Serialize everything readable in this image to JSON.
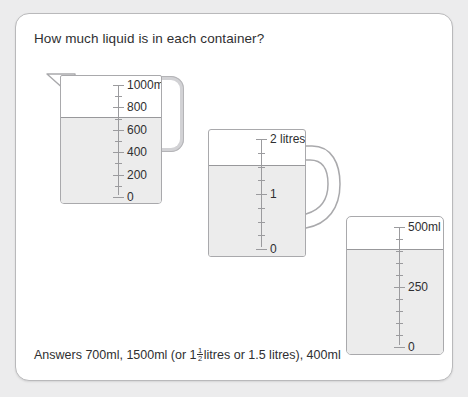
{
  "page": {
    "title": "How much liquid is in each container?",
    "background_color": "#ececed",
    "card_color": "#ffffff",
    "border_color": "#b9b9bb",
    "text_color": "#2f2f31",
    "liquid_color": "#ececec"
  },
  "answers": {
    "prefix": "Answers 700ml, 1500ml (or 1",
    "fraction_numerator": "1",
    "fraction_denominator": "2",
    "suffix": " litres or 1.5 litres), 400ml"
  },
  "containers": [
    {
      "id": "jug1",
      "name": "measuring-jug-1000ml",
      "unit": "ml",
      "scale_min": 0,
      "scale_max": 1000,
      "fill_value": 700,
      "has_spout": true,
      "handle_style": "rounded-rectangle",
      "major_step": 200,
      "minor_step": 100,
      "labels": [
        {
          "value": 1000,
          "text": "1000ml"
        },
        {
          "value": 800,
          "text": "800"
        },
        {
          "value": 600,
          "text": "600"
        },
        {
          "value": 400,
          "text": "400"
        },
        {
          "value": 200,
          "text": "200"
        },
        {
          "value": 0,
          "text": "0"
        }
      ]
    },
    {
      "id": "jug2",
      "name": "measuring-jug-2-litres",
      "unit": "litres",
      "scale_min": 0,
      "scale_max": 2,
      "fill_value": 1.5,
      "has_spout": false,
      "handle_style": "curved-mug",
      "major_step": 1,
      "minor_step": 0.25,
      "labels": [
        {
          "value": 2,
          "text": "2 litres"
        },
        {
          "value": 1,
          "text": "1"
        },
        {
          "value": 0,
          "text": "0"
        }
      ]
    },
    {
      "id": "jug3",
      "name": "measuring-beaker-500ml",
      "unit": "ml",
      "scale_min": 0,
      "scale_max": 500,
      "fill_value": 400,
      "has_spout": false,
      "handle_style": "none",
      "major_step": 250,
      "minor_step": 50,
      "labels": [
        {
          "value": 500,
          "text": "500ml"
        },
        {
          "value": 250,
          "text": "250"
        },
        {
          "value": 0,
          "text": "0"
        }
      ]
    }
  ]
}
